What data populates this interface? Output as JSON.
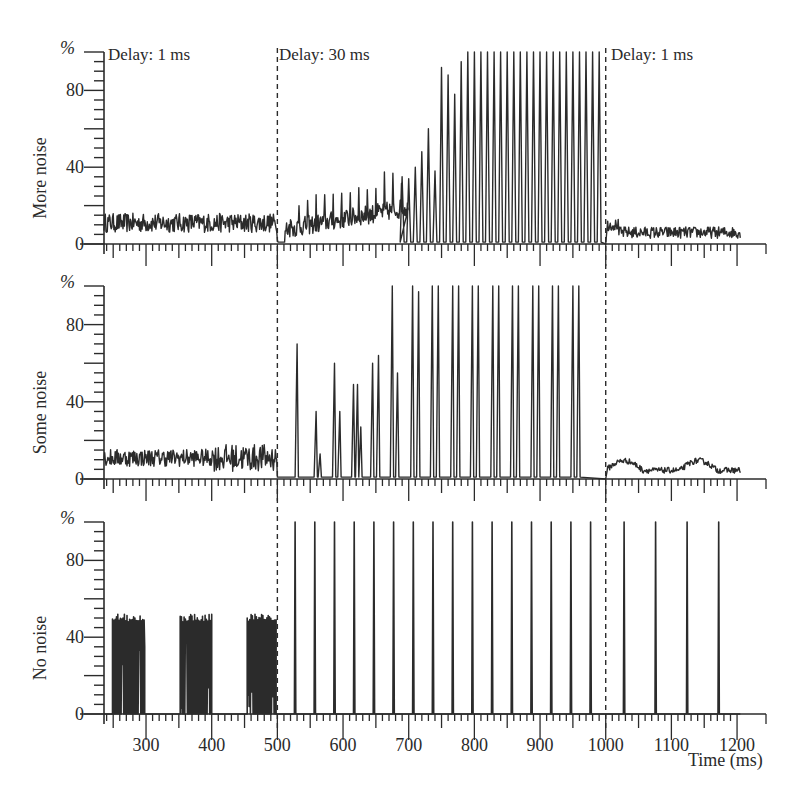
{
  "chart_data": {
    "type": "line",
    "title": "",
    "xlabel": "Time (ms)",
    "ylabel_unit": "%",
    "xlim": [
      236,
      1205
    ],
    "ylim": [
      0,
      100
    ],
    "x_ticks": [
      300,
      400,
      500,
      600,
      700,
      800,
      900,
      1000,
      1100,
      1200
    ],
    "x_tick_labels": [
      "300",
      "400",
      "500",
      "600",
      "700",
      "800",
      "900",
      "1000",
      "1100",
      "1200"
    ],
    "y_ticks": [
      0,
      40,
      80
    ],
    "y_tick_labels": [
      "0",
      "40",
      "80"
    ],
    "phase_boundaries_ms": [
      500,
      1000
    ],
    "phase_labels": [
      "Delay: 1 ms",
      "Delay: 30 ms",
      "Delay: 1 ms"
    ],
    "grid": false,
    "panels": [
      {
        "name": "More noise",
        "ylabel": "More noise",
        "segments": [
          {
            "range": [
              236,
              500
            ],
            "kind": "noise",
            "mean": 11,
            "amplitude": 5
          },
          {
            "range": [
              500,
              700
            ],
            "kind": "noisy-spikes",
            "description": "irregular activity rising from ~0 to ~25%"
          },
          {
            "range": [
              700,
              1000
            ],
            "kind": "spikes",
            "interval_ms": 10,
            "peak_values_start": [
              35,
              34,
              40,
              48,
              60,
              38,
              92,
              88,
              78,
              95
            ],
            "peak_value_rest": 100
          },
          {
            "range": [
              1000,
              1205
            ],
            "kind": "noise",
            "mean": 6,
            "amplitude": 3
          }
        ]
      },
      {
        "name": "Some noise",
        "ylabel": "Some noise",
        "segments": [
          {
            "range": [
              236,
              500
            ],
            "kind": "noise",
            "mean": 11,
            "amplitude": 6
          },
          {
            "range": [
              500,
              1000
            ],
            "kind": "spike-pairs",
            "spikes": [
              {
                "t": 530,
                "v": 70
              },
              {
                "t": 559,
                "v": 35
              },
              {
                "t": 565,
                "v": 13
              },
              {
                "t": 587,
                "v": 60
              },
              {
                "t": 595,
                "v": 35
              },
              {
                "t": 616,
                "v": 49
              },
              {
                "t": 622,
                "v": 49
              },
              {
                "t": 627,
                "v": 27
              },
              {
                "t": 645,
                "v": 60
              },
              {
                "t": 654,
                "v": 64
              },
              {
                "t": 675,
                "v": 100
              },
              {
                "t": 683,
                "v": 55
              },
              {
                "t": 706,
                "v": 100
              },
              {
                "t": 715,
                "v": 97
              },
              {
                "t": 736,
                "v": 100
              },
              {
                "t": 745,
                "v": 100
              },
              {
                "t": 767,
                "v": 100
              },
              {
                "t": 776,
                "v": 100
              },
              {
                "t": 797,
                "v": 100
              },
              {
                "t": 806,
                "v": 100
              },
              {
                "t": 828,
                "v": 100
              },
              {
                "t": 837,
                "v": 100
              },
              {
                "t": 858,
                "v": 100
              },
              {
                "t": 867,
                "v": 100
              },
              {
                "t": 889,
                "v": 100
              },
              {
                "t": 898,
                "v": 100
              },
              {
                "t": 919,
                "v": 100
              },
              {
                "t": 928,
                "v": 100
              },
              {
                "t": 950,
                "v": 100
              },
              {
                "t": 959,
                "v": 100
              }
            ]
          },
          {
            "range": [
              1000,
              1205
            ],
            "kind": "noise-bumps",
            "mean": 5,
            "amplitude": 5
          }
        ]
      },
      {
        "name": "No noise",
        "ylabel": "No noise",
        "segments": [
          {
            "range": [
              249,
              298
            ],
            "kind": "burst",
            "peak": 52,
            "trough_min": 0
          },
          {
            "range": [
              352,
              400
            ],
            "kind": "burst",
            "peak": 52,
            "trough_min": 0
          },
          {
            "range": [
              454,
              498
            ],
            "kind": "burst",
            "peak": 52,
            "trough_min": 0
          },
          {
            "range": [
              500,
              1000
            ],
            "kind": "spikes",
            "interval_ms": 30,
            "first_ms": 527,
            "peak_value": 100
          },
          {
            "range": [
              1000,
              1205
            ],
            "kind": "spikes",
            "interval_ms": 48,
            "first_ms": 1028,
            "peak_value": 100
          }
        ]
      }
    ]
  },
  "labels": {
    "percent": "%",
    "x_axis_title": "Time (ms)",
    "delay_1": "Delay: 1 ms",
    "delay_30": "Delay: 30 ms",
    "delay_1b": "Delay: 1 ms",
    "panel_top": "More noise",
    "panel_mid": "Some noise",
    "panel_bot": "No noise"
  }
}
